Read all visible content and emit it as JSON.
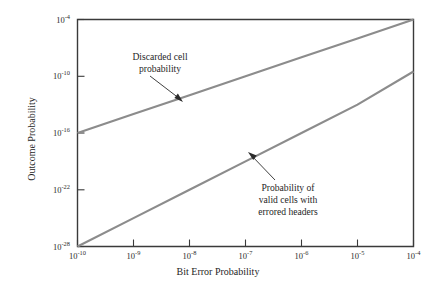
{
  "chart_data": {
    "type": "line",
    "title": "",
    "xlabel": "Bit Error Probability",
    "ylabel": "Outcome Probability",
    "xscale": "log",
    "yscale": "log",
    "xlim": [
      1e-10,
      0.0001
    ],
    "ylim": [
      1e-28,
      0.0001
    ],
    "grid": false,
    "legend": "none (inline annotations)",
    "xticks": [
      {
        "value": 1e-10,
        "mantissa": "10",
        "exponent": "-10"
      },
      {
        "value": 1e-09,
        "mantissa": "10",
        "exponent": "-9"
      },
      {
        "value": 1e-08,
        "mantissa": "10",
        "exponent": "-8"
      },
      {
        "value": 1e-07,
        "mantissa": "10",
        "exponent": "-7"
      },
      {
        "value": 1e-06,
        "mantissa": "10",
        "exponent": "-6"
      },
      {
        "value": 1e-05,
        "mantissa": "10",
        "exponent": "-5"
      },
      {
        "value": 0.0001,
        "mantissa": "10",
        "exponent": "-4"
      }
    ],
    "yticks": [
      {
        "value": 0.0001,
        "mantissa": "10",
        "exponent": "-4"
      },
      {
        "value": 1e-10,
        "mantissa": "10",
        "exponent": "-10"
      },
      {
        "value": 1e-16,
        "mantissa": "10",
        "exponent": "-16"
      },
      {
        "value": 1e-22,
        "mantissa": "10",
        "exponent": "-22"
      },
      {
        "value": 1e-28,
        "mantissa": "10",
        "exponent": "-28"
      }
    ],
    "series": [
      {
        "name": "Discarded cell probability",
        "color": "#8c8c8c",
        "x": [
          1e-10,
          1e-09,
          1e-08,
          1e-07,
          1e-06,
          1e-05,
          0.0001
        ],
        "y": [
          1e-16,
          1e-14,
          1e-12,
          1e-10,
          1e-08,
          1e-06,
          0.0001
        ]
      },
      {
        "name": "Probability of valid cells with errored headers",
        "color": "#8c8c8c",
        "x": [
          1e-10,
          1e-09,
          1e-08,
          1e-07,
          1e-06,
          1e-05,
          0.0001
        ],
        "y": [
          1e-28,
          1e-25,
          1e-22,
          1e-19,
          1e-16,
          1e-13,
          3.2e-10
        ]
      }
    ],
    "annotations": [
      {
        "id": "discarded",
        "lines": [
          "Discarded cell",
          "probability"
        ],
        "points_to_series": "Discarded cell probability"
      },
      {
        "id": "valid-errored",
        "lines": [
          "Probability of",
          "valid cells with",
          "errored headers"
        ],
        "points_to_series": "Probability of valid cells with errored headers"
      }
    ]
  },
  "axes": {
    "x_title": "Bit Error Probability",
    "y_title": "Outcome Probability"
  },
  "ticklabels": {
    "x": [
      {
        "m": "10",
        "e": "-10"
      },
      {
        "m": "10",
        "e": "-9"
      },
      {
        "m": "10",
        "e": "-8"
      },
      {
        "m": "10",
        "e": "-7"
      },
      {
        "m": "10",
        "e": "-6"
      },
      {
        "m": "10",
        "e": "-5"
      },
      {
        "m": "10",
        "e": "-4"
      }
    ],
    "y": [
      {
        "m": "10",
        "e": "-4"
      },
      {
        "m": "10",
        "e": "-10"
      },
      {
        "m": "10",
        "e": "-16"
      },
      {
        "m": "10",
        "e": "-22"
      },
      {
        "m": "10",
        "e": "-28"
      }
    ]
  },
  "annotations": {
    "discarded": {
      "line1": "Discarded cell",
      "line2": "probability"
    },
    "valid_errored": {
      "line1": "Probability of",
      "line2": "valid cells with",
      "line3": "errored headers"
    }
  },
  "colors": {
    "series": "#8c8c8c",
    "axis": "#3a3a3a",
    "text": "#1f1f1f",
    "background": "#ffffff"
  }
}
